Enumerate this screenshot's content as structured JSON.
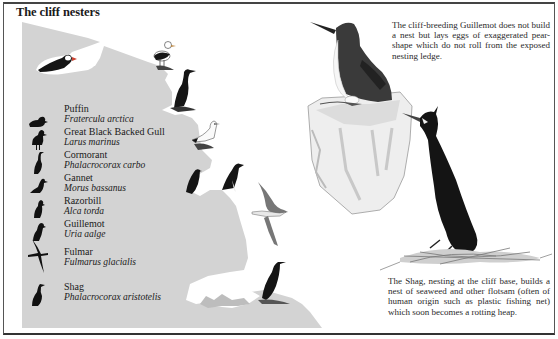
{
  "page": {
    "title": "The cliff nesters"
  },
  "legend": {
    "items": [
      {
        "common": "Puffin",
        "scientific": "Fratercula arctica",
        "icon": "puffin-silhouette-icon"
      },
      {
        "common": "Great Black Backed Gull",
        "scientific": "Larus marinus",
        "icon": "gull-silhouette-icon"
      },
      {
        "common": "Cormorant",
        "scientific": "Phalacrocorax carbo",
        "icon": "cormorant-silhouette-icon"
      },
      {
        "common": "Gannet",
        "scientific": "Morus bassanus",
        "icon": "gannet-silhouette-icon"
      },
      {
        "common": "Razorbill",
        "scientific": "Alca torda",
        "icon": "razorbill-silhouette-icon"
      },
      {
        "common": "Guillemot",
        "scientific": "Uria aalge",
        "icon": "guillemot-silhouette-icon"
      },
      {
        "common": "Fulmar",
        "scientific": "Fulmarus glacialis",
        "icon": "fulmar-silhouette-icon"
      },
      {
        "common": "Shag",
        "scientific": "Phalacrocorax aristotelis",
        "icon": "shag-silhouette-icon"
      }
    ]
  },
  "captions": {
    "guillemot": "The cliff-breeding Guillemot does not build a nest but lays eggs of exaggerated pear-shape which do not roll from the exposed nesting ledge.",
    "shag": "The Shag, nesting at the cliff base, builds a nest of seaweed and other flotsam (often of human origin such as plastic fishing net) which soon becomes a rotting heap."
  },
  "colors": {
    "cliff": "#d4d4d4",
    "bird_dark": "#151515",
    "frame": "#444444",
    "background": "#ffffff"
  }
}
